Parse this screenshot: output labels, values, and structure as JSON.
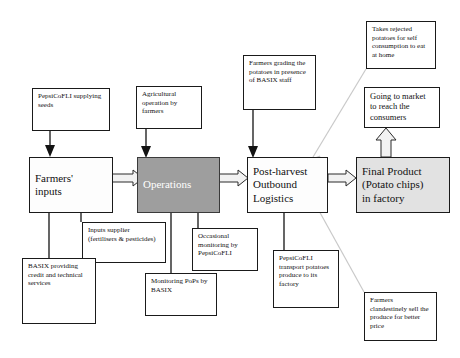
{
  "diagram": {
    "colors": {
      "operations_fill": "#9e9e9e",
      "final_product_fill": "#e2e2e2",
      "box_border": "#1a1a1a",
      "faint_connector": "#c9c9c9"
    },
    "chain": [
      {
        "id": "farmers-inputs",
        "label": "Farmers' inputs",
        "fill": "white"
      },
      {
        "id": "operations",
        "label": "Operations",
        "fill": "gray"
      },
      {
        "id": "post-harvest",
        "label": "Post-harvest Outbound Logistics",
        "fill": "white"
      },
      {
        "id": "final-product",
        "label": "Final Product (Potato chips) in factory",
        "fill": "light-gray"
      }
    ],
    "chain_labels": {
      "farmers_inputs_line1": "Farmers'",
      "farmers_inputs_line2": "inputs",
      "operations": "Operations",
      "post_harvest_line1": "Post-harvest",
      "post_harvest_line2": "Outbound",
      "post_harvest_line3": "Logistics",
      "final_product_line1": "Final Product",
      "final_product_line2": "(Potato chips)",
      "final_product_line3": "in factory"
    },
    "notes": {
      "pepsico_seeds": "PepsiCoFLI supplying seeds",
      "agricultural_operation": "Agricultural operation by farmers",
      "farmers_grading": "Farmers grading the potatoes in presence of BASIX staff",
      "takes_rejected": "Takes rejected potatoes for self consumption to eat at home",
      "going_to_market": "Going to market to reach the consumers",
      "inputs_supplier": "Inputs supplier (fertilisers & pesticides)",
      "basix_credit": "BASIX providing credit and technical services",
      "monitoring_pops": "Monitoring PoPs by BASIX",
      "occasional_monitoring": "Occasional monitoring  by PepsiCoFLI",
      "pepsico_transport": "PepsiCoFLI transport potatoes produce to its factory",
      "farmers_clandestine": "Farmers clandestinely sell the produce for better price"
    }
  }
}
